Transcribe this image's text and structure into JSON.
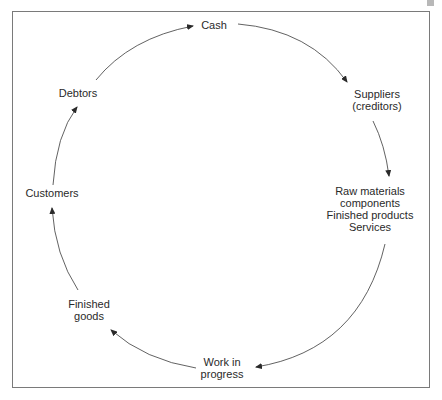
{
  "diagram": {
    "type": "cycle",
    "direction": "clockwise",
    "nodes": [
      {
        "id": "cash",
        "lines": [
          "Cash"
        ]
      },
      {
        "id": "suppliers",
        "lines": [
          "Suppliers",
          "(creditors)"
        ]
      },
      {
        "id": "inputs",
        "lines": [
          "Raw materials",
          "components",
          "Finished products",
          "Services"
        ]
      },
      {
        "id": "wip",
        "lines": [
          "Work in",
          "progress"
        ]
      },
      {
        "id": "finished_goods",
        "lines": [
          "Finished",
          "goods"
        ]
      },
      {
        "id": "customers",
        "lines": [
          "Customers"
        ]
      },
      {
        "id": "debtors",
        "lines": [
          "Debtors"
        ]
      }
    ],
    "edges": [
      {
        "from": "cash",
        "to": "suppliers"
      },
      {
        "from": "suppliers",
        "to": "inputs"
      },
      {
        "from": "inputs",
        "to": "wip"
      },
      {
        "from": "wip",
        "to": "finished_goods"
      },
      {
        "from": "finished_goods",
        "to": "customers"
      },
      {
        "from": "customers",
        "to": "debtors"
      },
      {
        "from": "debtors",
        "to": "cash"
      }
    ],
    "colors": {
      "line": "#3a3a3a",
      "text": "#2a2a2a",
      "frame": "#7a7a7a"
    }
  }
}
